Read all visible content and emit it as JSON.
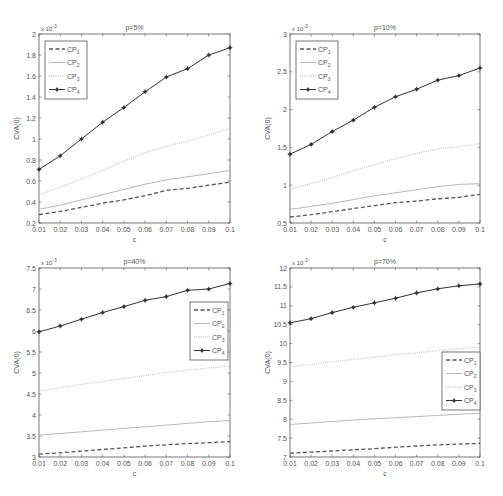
{
  "figure": {
    "series_names": [
      "CP1",
      "CP2",
      "CP3",
      "CP4"
    ],
    "x_ticks": [
      "0.01",
      "0.02",
      "0.03",
      "0.04",
      "0.05",
      "0.06",
      "0.07",
      "0.08",
      "0.09",
      "0.1"
    ],
    "xlabel": "c",
    "ylabel": "CVA(0)",
    "exponent_label": "x 10",
    "exponent": "-3",
    "colors": {
      "axes": "#555555",
      "cp1": "#555555",
      "cp2": "#b8b8b8",
      "cp3": "#c8c8c8",
      "cp4": "#333333"
    }
  },
  "chart_data": [
    {
      "type": "line",
      "title": "p=5%",
      "xlabel": "c",
      "ylabel": "CVA(0)",
      "y_scale": "x 10^-3",
      "x": [
        0.01,
        0.02,
        0.03,
        0.04,
        0.05,
        0.06,
        0.07,
        0.08,
        0.09,
        0.1
      ],
      "ylim": [
        0.2,
        2
      ],
      "yticks": [
        0.2,
        0.4,
        0.6,
        0.8,
        1,
        1.2,
        1.4,
        1.6,
        1.8,
        2
      ],
      "legend_position": "upper-left",
      "series": [
        {
          "name": "CP1",
          "style": "dashed",
          "values": [
            0.28,
            0.31,
            0.35,
            0.39,
            0.42,
            0.46,
            0.51,
            0.53,
            0.56,
            0.59
          ]
        },
        {
          "name": "CP2",
          "style": "solid-light",
          "values": [
            0.33,
            0.37,
            0.42,
            0.47,
            0.52,
            0.57,
            0.61,
            0.64,
            0.67,
            0.7
          ]
        },
        {
          "name": "CP3",
          "style": "dotted",
          "values": [
            0.47,
            0.54,
            0.62,
            0.7,
            0.79,
            0.87,
            0.93,
            0.98,
            1.04,
            1.1
          ]
        },
        {
          "name": "CP4",
          "style": "solid-marker",
          "values": [
            0.71,
            0.84,
            1.0,
            1.16,
            1.3,
            1.45,
            1.59,
            1.67,
            1.8,
            1.87
          ]
        }
      ]
    },
    {
      "type": "line",
      "title": "p=10%",
      "xlabel": "c",
      "ylabel": "CVA(0)",
      "y_scale": "x 10^-3",
      "x": [
        0.01,
        0.02,
        0.03,
        0.04,
        0.05,
        0.06,
        0.07,
        0.08,
        0.09,
        0.1
      ],
      "ylim": [
        0.5,
        3
      ],
      "yticks": [
        0.5,
        1,
        1.5,
        2,
        2.5,
        3
      ],
      "legend_position": "upper-left",
      "series": [
        {
          "name": "CP1",
          "style": "dashed",
          "values": [
            0.58,
            0.61,
            0.65,
            0.69,
            0.73,
            0.77,
            0.79,
            0.82,
            0.84,
            0.88
          ]
        },
        {
          "name": "CP2",
          "style": "solid-light",
          "values": [
            0.68,
            0.72,
            0.76,
            0.81,
            0.86,
            0.9,
            0.94,
            0.98,
            1.01,
            1.02
          ]
        },
        {
          "name": "CP3",
          "style": "dotted",
          "values": [
            0.95,
            1.02,
            1.1,
            1.19,
            1.27,
            1.35,
            1.42,
            1.48,
            1.51,
            1.55
          ]
        },
        {
          "name": "CP4",
          "style": "solid-marker",
          "values": [
            1.41,
            1.54,
            1.71,
            1.86,
            2.03,
            2.17,
            2.27,
            2.39,
            2.45,
            2.55
          ]
        }
      ]
    },
    {
      "type": "line",
      "title": "p=40%",
      "xlabel": "c",
      "ylabel": "CVA(0)",
      "y_scale": "x 10^-3",
      "x": [
        0.01,
        0.02,
        0.03,
        0.04,
        0.05,
        0.06,
        0.07,
        0.08,
        0.09,
        0.1
      ],
      "ylim": [
        3,
        7.5
      ],
      "yticks": [
        3,
        3.5,
        4,
        4.5,
        5,
        5.5,
        6,
        6.5,
        7,
        7.5
      ],
      "legend_position": "right",
      "series": [
        {
          "name": "CP1",
          "style": "dashed",
          "values": [
            3.07,
            3.1,
            3.14,
            3.18,
            3.22,
            3.26,
            3.29,
            3.32,
            3.34,
            3.37
          ]
        },
        {
          "name": "CP2",
          "style": "solid-light",
          "values": [
            3.52,
            3.56,
            3.6,
            3.64,
            3.68,
            3.72,
            3.76,
            3.8,
            3.84,
            3.87
          ]
        },
        {
          "name": "CP3",
          "style": "dotted",
          "values": [
            4.57,
            4.65,
            4.73,
            4.8,
            4.87,
            4.94,
            5.01,
            5.07,
            5.12,
            5.17
          ]
        },
        {
          "name": "CP4",
          "style": "solid-marker",
          "values": [
            5.98,
            6.12,
            6.28,
            6.44,
            6.58,
            6.73,
            6.82,
            6.97,
            7.0,
            7.13
          ]
        }
      ]
    },
    {
      "type": "line",
      "title": "p=70%",
      "xlabel": "c",
      "ylabel": "CVA(0)",
      "y_scale": "x 10^-3",
      "x": [
        0.01,
        0.02,
        0.03,
        0.04,
        0.05,
        0.06,
        0.07,
        0.08,
        0.09,
        0.1
      ],
      "ylim": [
        7,
        12
      ],
      "yticks": [
        7,
        7.5,
        8,
        8.5,
        9,
        9.5,
        10,
        10.5,
        11,
        11.5,
        12
      ],
      "legend_position": "lower-right",
      "series": [
        {
          "name": "CP1",
          "style": "dashed",
          "values": [
            7.1,
            7.13,
            7.16,
            7.19,
            7.22,
            7.26,
            7.29,
            7.32,
            7.34,
            7.36
          ]
        },
        {
          "name": "CP2",
          "style": "solid-light",
          "values": [
            7.86,
            7.9,
            7.94,
            7.98,
            8.01,
            8.04,
            8.07,
            8.1,
            8.13,
            8.16
          ]
        },
        {
          "name": "CP3",
          "style": "dotted",
          "values": [
            9.39,
            9.45,
            9.52,
            9.58,
            9.64,
            9.7,
            9.76,
            9.81,
            9.86,
            9.91
          ]
        },
        {
          "name": "CP4",
          "style": "solid-marker",
          "values": [
            10.55,
            10.66,
            10.82,
            10.96,
            11.08,
            11.2,
            11.34,
            11.45,
            11.53,
            11.58
          ]
        }
      ]
    }
  ]
}
